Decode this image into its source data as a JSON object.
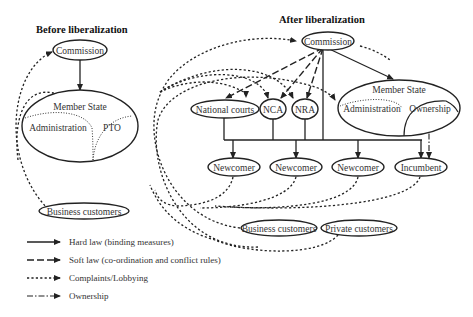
{
  "before": {
    "title": "Before liberalization",
    "commission": "Commission",
    "member_state": "Member State",
    "administration": "Administration",
    "pto": "PTO",
    "business_customers": "Business customers"
  },
  "after": {
    "title": "After liberalization",
    "commission": "Commission",
    "national_courts": "National courts",
    "nca": "NCA",
    "nra": "NRA",
    "member_state": "Member State",
    "administration": "Administration",
    "ownership": "Ownership",
    "newcomers": [
      "Newcomer",
      "Newcomer",
      "Newcomer"
    ],
    "incumbent": "Incumbent",
    "business_customers": "Business customers",
    "private_customers": "Private customers"
  },
  "legend": [
    {
      "style": "solid",
      "label": "Hard law (binding measures)"
    },
    {
      "style": "dashed",
      "label": "Soft law (co-ordination and conflict rules)"
    },
    {
      "style": "dotted",
      "label": "Complaints/Lobbying"
    },
    {
      "style": "dash-dot",
      "label": "Ownership"
    }
  ],
  "colors": {
    "line": "#222222",
    "background": "#ffffff"
  }
}
